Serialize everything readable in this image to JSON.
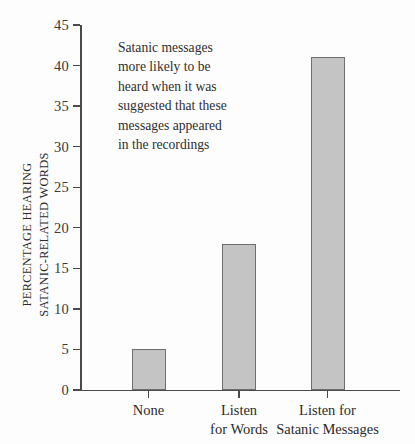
{
  "chart_data": {
    "type": "bar",
    "title": "",
    "xlabel": "",
    "ylabel": "PERCENTAGE HEARING SATANIC-RELATED WORDS",
    "ylabel_lines": [
      "PERCENTAGE HEARING",
      "SATANIC-RELATED WORDS"
    ],
    "categories": [
      "None",
      "Listen for Words",
      "Listen for Satanic Messages"
    ],
    "category_lines": [
      [
        "None"
      ],
      [
        "Listen",
        "for Words"
      ],
      [
        "Listen for",
        "Satanic Messages"
      ]
    ],
    "values": [
      5,
      18,
      41
    ],
    "ylim": [
      0,
      45
    ],
    "yticks": [
      0,
      5,
      10,
      15,
      20,
      25,
      30,
      35,
      40,
      45
    ],
    "ytick_labels": [
      "0",
      "5",
      "10",
      "15",
      "20",
      "25",
      "30",
      "35",
      "40",
      "45"
    ],
    "grid": false,
    "legend": null,
    "annotations": [
      {
        "text": "Satanic messages more likely to be heard when it was suggested that these messages appeared in the recordings",
        "lines": [
          "Satanic messages",
          "more likely to be",
          "heard when it was",
          "suggested that these",
          "messages appeared",
          "in the recordings"
        ]
      }
    ],
    "colors": {
      "bar_fill": "#c4c4c4",
      "bar_border": "#6e6e6e",
      "axis": "#4a4a4a",
      "text": "#2b2b2b",
      "background": "#fdfdfd"
    }
  }
}
